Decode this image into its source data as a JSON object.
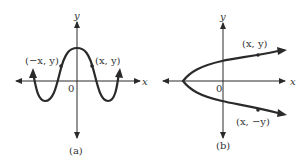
{
  "panels": [
    {
      "id": "a",
      "caption": "(a)",
      "axis_x_label": "x",
      "axis_y_label": "y",
      "origin_label": "0",
      "curve": "even function (symmetric about y-axis), cosine-like wave with peak at y-intercept",
      "points": [
        {
          "label": "(−x, y)"
        },
        {
          "label": "(x, y)"
        }
      ]
    },
    {
      "id": "b",
      "caption": "(b)",
      "axis_x_label": "x",
      "axis_y_label": "y",
      "origin_label": "0",
      "curve": "sideways parabola opening right (symmetric about x-axis)",
      "points": [
        {
          "label": "(x, y)"
        },
        {
          "label": "(x, −y)"
        }
      ]
    }
  ],
  "colors": {
    "ink": "#2a2a2a",
    "background": "#ffffff"
  }
}
